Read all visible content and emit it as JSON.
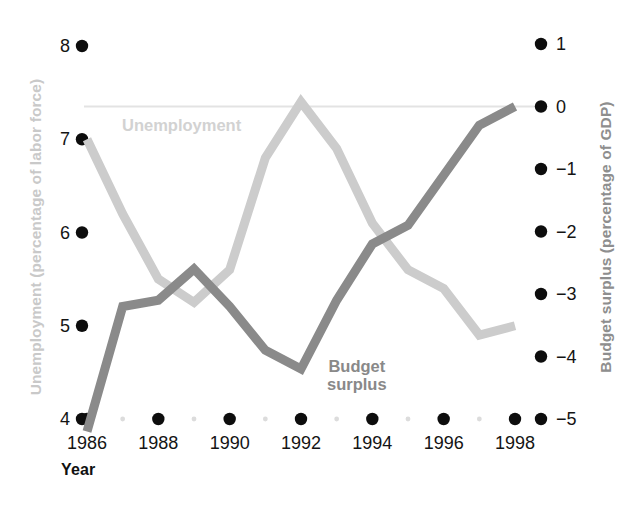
{
  "axes": {
    "y_left_title": "Unemployment (percentage of labor force)",
    "y_right_title": "Budget surplus (percentage of GDP)",
    "x_title": "Year",
    "y_left_ticks": [
      "8",
      "7",
      "6",
      "5",
      "4"
    ],
    "y_right_ticks": [
      "1",
      "0",
      "−1",
      "−2",
      "−3",
      "−4",
      "−5"
    ],
    "x_ticks": [
      "1986",
      "1988",
      "1990",
      "1992",
      "1994",
      "1996",
      "1998"
    ]
  },
  "series_labels": {
    "unemployment": "Unemployment",
    "budget": "Budget\nsurplus"
  },
  "colors": {
    "unemployment": "#cccccc",
    "budget": "#8a8a8a",
    "zero_line": "#e3e3e3",
    "tick_dot": "#0d0d0d",
    "minor_dot": "#dcdcdc",
    "left_title": "#c9c9c9",
    "right_title": "#8e8e8e"
  },
  "chart_data": {
    "type": "line",
    "title": "",
    "xlabel": "Year",
    "grid": false,
    "legend": "inline-annotations",
    "x": [
      1986,
      1987,
      1988,
      1989,
      1990,
      1991,
      1992,
      1993,
      1994,
      1995,
      1996,
      1997,
      1998
    ],
    "axes": {
      "x": {
        "min": 1986,
        "max": 1998,
        "ticks": [
          1986,
          1988,
          1990,
          1992,
          1994,
          1996,
          1998
        ],
        "minor_ticks": [
          1987,
          1989,
          1991,
          1993,
          1995,
          1997
        ]
      },
      "y_left": {
        "label": "Unemployment (percentage of labor force)",
        "min": 4,
        "max": 8,
        "ticks": [
          8,
          7,
          6,
          5,
          4
        ]
      },
      "y_right": {
        "label": "Budget surplus (percentage of GDP)",
        "min": -5,
        "max": 1,
        "ticks": [
          1,
          0,
          -1,
          -2,
          -3,
          -4,
          -5
        ]
      }
    },
    "series": [
      {
        "name": "Unemployment",
        "axis": "y_left",
        "color": "#cccccc",
        "units": "percentage of labor force",
        "values": [
          7.0,
          6.2,
          5.5,
          5.25,
          5.6,
          6.8,
          7.4,
          6.9,
          6.1,
          5.6,
          5.4,
          4.9,
          5.0
        ]
      },
      {
        "name": "Budget surplus",
        "axis": "y_right",
        "color": "#8a8a8a",
        "units": "percentage of GDP",
        "values": [
          -5.2,
          -3.2,
          -3.1,
          -2.6,
          -3.2,
          -3.9,
          -4.2,
          -3.1,
          -2.2,
          -1.9,
          -1.1,
          -0.3,
          0.0
        ]
      }
    ],
    "annotations": [
      {
        "text": "Unemployment",
        "near_x": 1987.6,
        "near_y_left": 7.15
      },
      {
        "text": "Budget surplus",
        "near_x": 1993.5,
        "near_y_right": -4.0
      }
    ],
    "reference_lines": [
      {
        "axis": "y_right",
        "value": 0,
        "color": "#e3e3e3"
      }
    ]
  }
}
